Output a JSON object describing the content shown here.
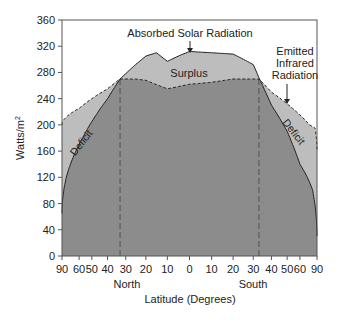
{
  "chart_data": {
    "type": "area",
    "title": "",
    "xlabel": "Latitude (Degrees)",
    "ylabel": "Watts/m2",
    "ylim": [
      0,
      360
    ],
    "yticks": [
      0,
      40,
      80,
      120,
      160,
      200,
      240,
      280,
      320,
      360
    ],
    "xticks": [
      {
        "label": "90",
        "lat": -90
      },
      {
        "label": "60",
        "lat": -60
      },
      {
        "label": "50",
        "lat": -50
      },
      {
        "label": "40",
        "lat": -40
      },
      {
        "label": "30",
        "lat": -30
      },
      {
        "label": "20",
        "lat": -20
      },
      {
        "label": "10",
        "lat": -10
      },
      {
        "label": "0",
        "lat": 0
      },
      {
        "label": "10",
        "lat": 10
      },
      {
        "label": "20",
        "lat": 20
      },
      {
        "label": "30",
        "lat": 30
      },
      {
        "label": "40",
        "lat": 40
      },
      {
        "label": "50",
        "lat": 50
      },
      {
        "label": "60",
        "lat": 60
      },
      {
        "label": "90",
        "lat": 90
      }
    ],
    "x_scale": "sine of latitude",
    "hemisphere_labels": {
      "north": "North",
      "south": "South"
    },
    "grid": false,
    "series": [
      {
        "name": "Absorbed Solar Radiation",
        "style": "solid",
        "lat": [
          -90,
          -75,
          -60,
          -50,
          -40,
          -33,
          -25,
          -20,
          -15,
          -10,
          -5,
          0,
          10,
          20,
          30,
          33,
          40,
          50,
          60,
          75,
          90
        ],
        "values": [
          65,
          120,
          170,
          205,
          240,
          270,
          292,
          305,
          310,
          297,
          305,
          312,
          310,
          308,
          292,
          272,
          230,
          190,
          140,
          100,
          30
        ]
      },
      {
        "name": "Emitted Infrared Radiation",
        "style": "dashed",
        "lat": [
          -90,
          -75,
          -60,
          -50,
          -40,
          -33,
          -25,
          -20,
          -10,
          0,
          10,
          20,
          33,
          40,
          50,
          60,
          70,
          80,
          90
        ],
        "values": [
          200,
          212,
          225,
          240,
          255,
          270,
          270,
          268,
          255,
          262,
          265,
          270,
          270,
          250,
          232,
          215,
          200,
          195,
          160
        ]
      }
    ],
    "annotations": [
      {
        "text": "Absorbed Solar Radiation",
        "points_to_lat": 0
      },
      {
        "text": "Emitted Infrared Radiation",
        "points_to_lat": 55
      },
      {
        "text": "Surplus"
      },
      {
        "text": "Deficit",
        "region": "north"
      },
      {
        "text": "Deficit",
        "region": "south"
      }
    ],
    "reference_lines": [
      {
        "lat": -33,
        "style": "dashed"
      },
      {
        "lat": 33,
        "style": "dashed"
      }
    ],
    "colors": {
      "surplus_deficit_fill": "#bdbdbd",
      "base_fill": "#8c8c8c",
      "line": "#222222"
    }
  },
  "labels": {
    "ylabel": "Watts/m",
    "ylabel_sup": "2",
    "xlabel": "Latitude (Degrees)",
    "north": "North",
    "south": "South",
    "absorbed": "Absorbed Solar Radiation",
    "emitted_1": "Emitted",
    "emitted_2": "Infrared",
    "emitted_3": "Radiation",
    "surplus": "Surplus",
    "deficit_n": "Deficit",
    "deficit_s": "Deficit"
  }
}
